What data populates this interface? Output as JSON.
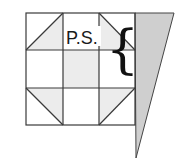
{
  "diagram": {
    "type": "quilt-block",
    "grid": {
      "rows": 3,
      "cols": 3,
      "x": 26,
      "y": 13,
      "cell": 36.3
    },
    "label": "P.S.",
    "brace": "{",
    "colors": {
      "line": "#3a3a3a",
      "shade": "#ececec",
      "triangle_fill": "#cfcfcf"
    },
    "shaded_cells": [
      [
        1,
        1
      ]
    ],
    "half_square_triangles": [
      {
        "row": 0,
        "col": 0,
        "diagonal": "bl-tr",
        "shaded": "lower-right"
      },
      {
        "row": 0,
        "col": 2,
        "diagonal": "tl-br",
        "shaded": "lower-left"
      },
      {
        "row": 2,
        "col": 0,
        "diagonal": "tl-br",
        "shaded": "upper-right"
      },
      {
        "row": 2,
        "col": 2,
        "diagonal": "bl-tr",
        "shaded": "upper-left"
      }
    ],
    "side_triangle": {
      "points": "135,13 174,13 136,158"
    }
  }
}
